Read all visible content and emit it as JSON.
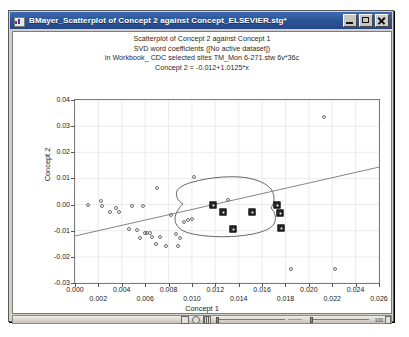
{
  "window": {
    "title": "BMayer_Scatterplot of Concept 2 against Concept_ELSEVIER.stg*",
    "icon": "statistica-graph-icon",
    "minimize_label": "",
    "maximize_label": "",
    "close_label": ""
  },
  "chart_titles": [
    "Scatterplot of Concept 2 against Concept 1",
    "SVD word coefficients ([No active dataset])",
    "in Workbook_ CDC selected sites TM_Mon 6-271.stw 6v*36c",
    "Concept 2 = -0.012+1.0125*x"
  ],
  "bottom_bar": {
    "zoom_value": "100",
    "icons": [
      "marker-tool-icon",
      "circle-tool-icon",
      "bars-tool-icon"
    ]
  },
  "chart_data": {
    "type": "scatter",
    "title": "Scatterplot of Concept 2 against Concept 1",
    "subtitle": "SVD word coefficients ([No active dataset])",
    "subtitle2": "in Workbook_ CDC selected sites TM_Mon 6-271.stw 6v*36c",
    "fit_equation": "Concept 2 = -0.012+1.0125*x",
    "xlabel": "Concept 1",
    "ylabel": "Concept 2",
    "xlim": [
      0.0,
      0.026
    ],
    "ylim": [
      -0.03,
      0.04
    ],
    "xticks": [
      0.0,
      0.002,
      0.004,
      0.006,
      0.008,
      0.01,
      0.012,
      0.014,
      0.016,
      0.018,
      0.02,
      0.022,
      0.024,
      0.026
    ],
    "xticklabels": [
      "0.000",
      "0.002",
      "0.004",
      "0.006",
      "0.008",
      "0.010",
      "0.012",
      "0.014",
      "0.016",
      "0.018",
      "0.020",
      "0.022",
      "0.024",
      "0.026"
    ],
    "yticks": [
      -0.03,
      -0.02,
      -0.01,
      0.0,
      0.01,
      0.02,
      0.03,
      0.04
    ],
    "yticklabels": [
      "-0.03",
      "-0.02",
      "-0.01",
      "0.00",
      "0.01",
      "0.02",
      "0.03",
      "0.04"
    ],
    "grid": true,
    "legend": null,
    "regression_line": {
      "intercept": -0.012,
      "slope": 1.0125,
      "x_from": 0.0,
      "x_to": 0.026
    },
    "lasso_selection_outline": true,
    "series": [
      {
        "name": "unselected points",
        "marker": "open-circle",
        "points": [
          [
            0.0011,
            -0.0002
          ],
          [
            0.0022,
            0.0014
          ],
          [
            0.0023,
            -0.0005
          ],
          [
            0.003,
            -0.0029
          ],
          [
            0.0035,
            -0.0013
          ],
          [
            0.0038,
            -0.003
          ],
          [
            0.0046,
            -0.0094
          ],
          [
            0.0049,
            -0.0004
          ],
          [
            0.0053,
            -0.0097
          ],
          [
            0.0056,
            -0.0127
          ],
          [
            0.0058,
            -0.0005
          ],
          [
            0.006,
            -0.0107
          ],
          [
            0.0062,
            -0.011
          ],
          [
            0.0064,
            -0.011
          ],
          [
            0.0066,
            -0.0125
          ],
          [
            0.0069,
            -0.015
          ],
          [
            0.007,
            0.0064
          ],
          [
            0.0073,
            -0.0123
          ],
          [
            0.0078,
            -0.016
          ],
          [
            0.0082,
            -0.004
          ],
          [
            0.0086,
            -0.0112
          ],
          [
            0.0088,
            -0.0158
          ],
          [
            0.009,
            -0.0128
          ],
          [
            0.0093,
            -0.0066
          ],
          [
            0.0097,
            -0.0058
          ],
          [
            0.01,
            -0.0055
          ],
          [
            0.0102,
            0.0107
          ],
          [
            0.0131,
            0.0016
          ],
          [
            0.0185,
            -0.0247
          ],
          [
            0.0213,
            0.0334
          ],
          [
            0.0222,
            -0.0246
          ]
        ]
      },
      {
        "name": "selected points",
        "marker": "filled-square",
        "points": [
          [
            0.0118,
            -0.0002
          ],
          [
            0.0127,
            -0.0029
          ],
          [
            0.0135,
            -0.0093
          ],
          [
            0.0151,
            -0.0029
          ],
          [
            0.0173,
            -0.0001
          ],
          [
            0.0175,
            -0.0031
          ],
          [
            0.0176,
            -0.009
          ]
        ]
      }
    ]
  }
}
